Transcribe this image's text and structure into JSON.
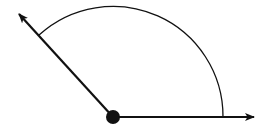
{
  "diagram": {
    "type": "angle",
    "colors": {
      "stroke": "#111111",
      "background": "#ffffff"
    },
    "vertex": {
      "x": 113,
      "y": 117,
      "radius": 7
    },
    "ray_right": {
      "x1": 113,
      "y1": 117,
      "x2": 254,
      "y2": 117
    },
    "ray_left": {
      "x1": 113,
      "y1": 117,
      "x2": 19,
      "y2": 14
    },
    "arc": {
      "cx": 113,
      "cy": 117,
      "r": 110,
      "start": {
        "x": 39,
        "y": 35
      },
      "end": {
        "x": 223,
        "y": 117
      }
    },
    "approx_angle_degrees": 132
  }
}
